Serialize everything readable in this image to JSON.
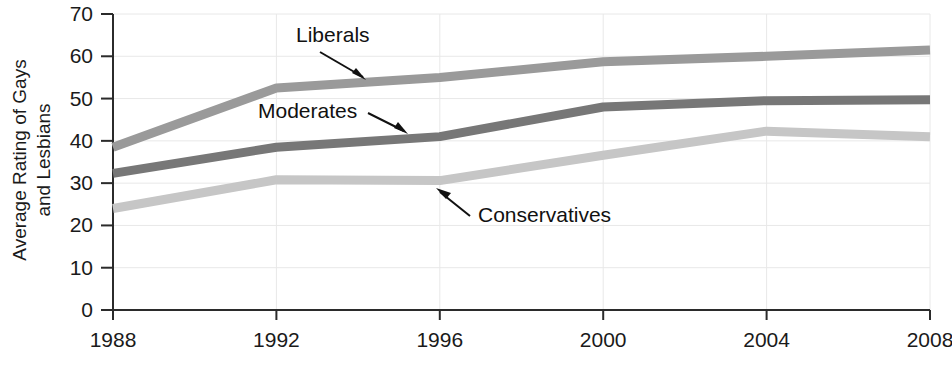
{
  "chart_data": {
    "type": "line",
    "title": "",
    "subtitle": "",
    "xlabel": "",
    "ylabel": "Average Rating of Gays and Lesbians",
    "ylabel_line1": "Average Rating of Gays",
    "ylabel_line2": "and Lesbians",
    "x": [
      1988,
      1992,
      1996,
      2000,
      2004,
      2008
    ],
    "categories": [
      "1988",
      "1992",
      "1996",
      "2000",
      "2004",
      "2008"
    ],
    "xlim": [
      1988,
      2008
    ],
    "ylim": [
      0,
      70
    ],
    "yticks": [
      0,
      10,
      20,
      30,
      40,
      50,
      60,
      70
    ],
    "ytick_labels": [
      "0",
      "10",
      "20",
      "30",
      "40",
      "50",
      "60",
      "70"
    ],
    "xticks": [
      1988,
      1992,
      1996,
      2000,
      2004,
      2008
    ],
    "xtick_labels": [
      "1988",
      "1992",
      "1996",
      "2000",
      "2004",
      "2008"
    ],
    "grid": true,
    "legend": "none",
    "legend_position": "inline-annotations",
    "series": [
      {
        "name": "Liberals",
        "color": "#9a9a9a",
        "values": [
          38.5,
          52.5,
          55.0,
          58.7,
          60.0,
          61.5
        ]
      },
      {
        "name": "Moderates",
        "color": "#777777",
        "values": [
          32.3,
          38.5,
          41.0,
          48.0,
          49.5,
          49.7
        ]
      },
      {
        "name": "Conservatives",
        "color": "#c6c6c6",
        "values": [
          24.0,
          30.8,
          30.6,
          36.6,
          42.3,
          41.0
        ]
      }
    ],
    "annotations": [
      {
        "text": "Liberals",
        "target_series": "Liberals"
      },
      {
        "text": "Moderates",
        "target_series": "Moderates"
      },
      {
        "text": "Conservatives",
        "target_series": "Conservatives"
      }
    ]
  }
}
